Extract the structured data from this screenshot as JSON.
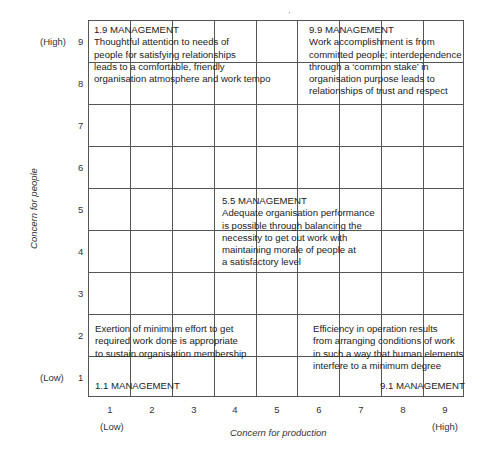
{
  "diagram": {
    "type": "managerial-grid",
    "x_axis": {
      "title": "Concern for production",
      "ticks": [
        "1",
        "2",
        "3",
        "4",
        "5",
        "6",
        "7",
        "8",
        "9"
      ],
      "low_label": "(Low)",
      "high_label": "(High)"
    },
    "y_axis": {
      "title": "Concern for people",
      "ticks": [
        "9",
        "8",
        "7",
        "6",
        "5",
        "4",
        "3",
        "2",
        "1"
      ],
      "high_label": "(High)",
      "low_label": "(Low)"
    },
    "styles": [
      {
        "title": "1.9 MANAGEMENT",
        "lines": [
          "Thoughtful attention to needs of",
          "people for satisfying relationships",
          "leads to a comfortable, friendly",
          "organisation atmosphere and work tempo"
        ]
      },
      {
        "title": "9.9 MANAGEMENT",
        "lines": [
          "Work accomplishment is from",
          "committed people; interdependence",
          "through a ‘common stake’ in",
          "organisation purpose leads to",
          "relationships of trust and respect"
        ]
      },
      {
        "title": "5.5 MANAGEMENT",
        "lines": [
          "Adequate organisation performance",
          "is possible through balancing the",
          "necessity to get out work with",
          "maintaining morale of people at",
          "a satisfactory level"
        ]
      },
      {
        "title": "1.1 MANAGEMENT",
        "lines": [
          "Exertion of minimum effort to get",
          "required work done is appropriate",
          "to sustain organisation membership"
        ]
      },
      {
        "title": "9.1 MANAGEMENT",
        "lines": [
          "Efficiency in operation results",
          "from arranging conditions of work",
          "in such a way that human elements",
          "interfere to a minimum degree"
        ]
      }
    ]
  }
}
